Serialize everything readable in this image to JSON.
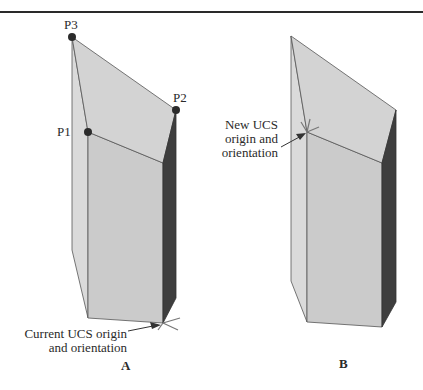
{
  "figure_a": {
    "points": {
      "p1": "P1",
      "p2": "P2",
      "p3": "P3"
    },
    "callout_line1": "Current UCS origin",
    "callout_line2": "and orientation",
    "caption": "A"
  },
  "figure_b": {
    "callout_line1": "New UCS",
    "callout_line2": "origin and",
    "callout_line3": "orientation",
    "caption": "B"
  },
  "colors": {
    "top_face": "#d4d4d4",
    "front_face": "#cbcbcb",
    "left_face": "#d9d9d9",
    "right_face": "#3f3f3f",
    "edge": "#555555",
    "point": "#2b2b2b"
  }
}
